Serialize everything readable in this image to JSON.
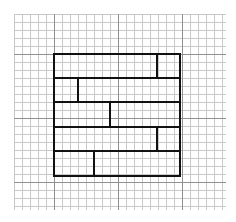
{
  "diagram": {
    "canvas": {
      "width": 236,
      "height": 222,
      "background": "#ffffff"
    },
    "grid": {
      "x_start": 14,
      "y_start": 14,
      "x_end": 226,
      "y_end": 210,
      "spacing": 8,
      "minor_color": "#c8c8c8",
      "major_color": "#909090",
      "major_x": [
        54,
        118,
        182
      ],
      "major_y": [
        54,
        118,
        182
      ]
    },
    "box": {
      "x": 54,
      "y": 54,
      "width": 126,
      "height": 122,
      "stroke": "#111111",
      "stroke_width": 2
    },
    "rows": [
      {
        "y_top": 54,
        "y_bottom": 78,
        "divider_x": 157
      },
      {
        "y_top": 78,
        "y_bottom": 102,
        "divider_x": 78
      },
      {
        "y_top": 102,
        "y_bottom": 127,
        "divider_x": 110
      },
      {
        "y_top": 127,
        "y_bottom": 151,
        "divider_x": 157
      },
      {
        "y_top": 151,
        "y_bottom": 176,
        "divider_x": 94
      }
    ]
  }
}
